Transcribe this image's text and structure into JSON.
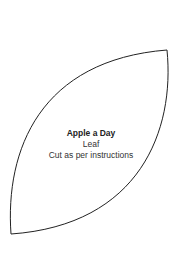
{
  "template": {
    "title": "Apple a Day",
    "piece": "Leaf",
    "instructions": "Cut as per instructions",
    "outline_color": "#222222",
    "background": "#ffffff"
  }
}
